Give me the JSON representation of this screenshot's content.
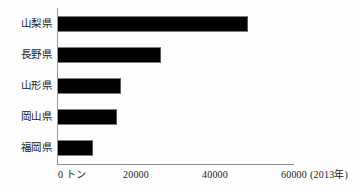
{
  "chart_data": {
    "type": "bar",
    "orientation": "horizontal",
    "title": "",
    "subtitle": "",
    "xlabel": "0 トン",
    "ylabel": "",
    "categories": [
      "山梨県",
      "長野県",
      "山形県",
      "岡山県",
      "福岡県"
    ],
    "values": [
      48000,
      26000,
      16000,
      15000,
      8800
    ],
    "series": [
      {
        "name": "生産量",
        "values": [
          48000,
          26000,
          16000,
          15000,
          8800
        ]
      }
    ],
    "xlim": [
      0,
      60000
    ],
    "xticks": [
      0,
      20000,
      40000,
      60000
    ],
    "xticklabels": [
      "0 トン",
      "20000",
      "40000",
      "60000"
    ],
    "grid": false,
    "legend": false,
    "legend_position": "none",
    "annotations": [
      "(2013年)"
    ],
    "bar_color": "#000000",
    "axis_color": "#8e8e8e",
    "background_color": "#fdfdfd"
  },
  "axis": {
    "year_note": "(2013年)",
    "ticks": [
      {
        "label": "0 トン",
        "value": 0
      },
      {
        "label": "20000",
        "value": 20000
      },
      {
        "label": "40000",
        "value": 40000
      },
      {
        "label": "60000",
        "value": 60000
      }
    ]
  },
  "bars": [
    {
      "label": "山梨県",
      "value": 48000
    },
    {
      "label": "長野県",
      "value": 26000
    },
    {
      "label": "山形県",
      "value": 16000
    },
    {
      "label": "岡山県",
      "value": 15000
    },
    {
      "label": "福岡県",
      "value": 8800
    }
  ]
}
